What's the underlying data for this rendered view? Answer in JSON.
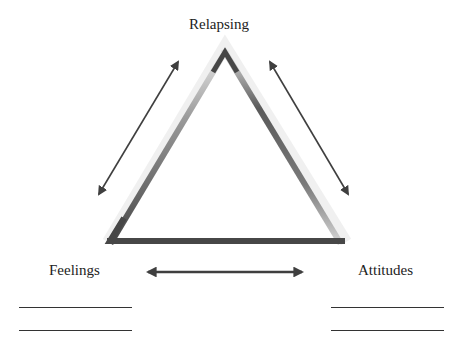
{
  "diagram": {
    "nodes": {
      "top": {
        "label": "Relapsing"
      },
      "left": {
        "label": "Feelings"
      },
      "right": {
        "label": "Attitudes"
      }
    },
    "connections": [
      {
        "from": "top",
        "to": "left",
        "type": "bidirectional-arrow"
      },
      {
        "from": "top",
        "to": "right",
        "type": "bidirectional-arrow"
      },
      {
        "from": "left",
        "to": "right",
        "type": "bidirectional-arrow"
      }
    ],
    "blank_lines": {
      "left": 2,
      "right": 2
    },
    "colors": {
      "stroke_dark": "#474747",
      "stroke_light": "#bdbdbd",
      "text": "#222222",
      "background": "#ffffff"
    }
  }
}
